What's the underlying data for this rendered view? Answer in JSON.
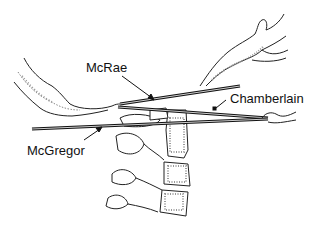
{
  "diagram": {
    "labels": [
      {
        "id": "mcrae",
        "text": "McRae",
        "x": 86,
        "y": 61
      },
      {
        "id": "chamberlain",
        "text": "Chamberlain",
        "x": 230,
        "y": 92
      },
      {
        "id": "mcgregor",
        "text": "McGregor",
        "x": 27,
        "y": 144
      }
    ],
    "lines": [
      {
        "id": "mcrae-line",
        "name": "McRae",
        "from": [
          120,
          103
        ],
        "to": [
          240,
          85
        ]
      },
      {
        "id": "chamberlain-line",
        "name": "Chamberlain",
        "from": [
          118,
          107
        ],
        "to": [
          268,
          118
        ]
      },
      {
        "id": "mcgregor-line",
        "name": "McGregor",
        "from": [
          32,
          128
        ],
        "to": [
          268,
          120
        ]
      }
    ],
    "colors": {
      "line": "#111111",
      "stroke": "#222222",
      "stipple": "#999999",
      "background": "#ffffff"
    }
  }
}
